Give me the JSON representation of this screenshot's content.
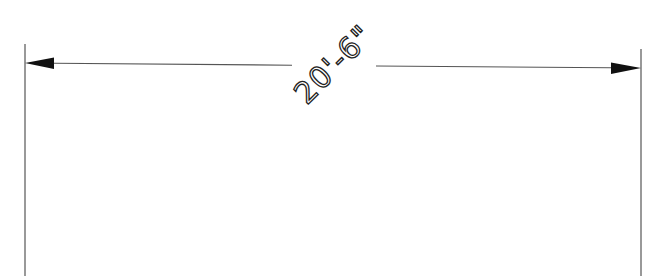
{
  "drawing": {
    "type": "linear-dimension",
    "dimension_text": "20'-6\"",
    "text_rotation_deg": -45,
    "colors": {
      "background": "#ffffff",
      "line": "#555555",
      "arrow": "#111111",
      "text": "#222222"
    },
    "extension_lines": {
      "left": {
        "x": 25,
        "y_top": 44,
        "y_bottom": 276
      },
      "right": {
        "x": 641,
        "y_top": 49,
        "y_bottom": 276
      }
    },
    "dimension_line": {
      "start": [
        25,
        63
      ],
      "end": [
        641,
        68
      ],
      "text_gap": [
        292,
        376
      ]
    },
    "arrowheads": {
      "left": {
        "tip": [
          25,
          63
        ],
        "base_x": 54
      },
      "right": {
        "tip": [
          641,
          68
        ],
        "base_x": 611
      }
    }
  }
}
